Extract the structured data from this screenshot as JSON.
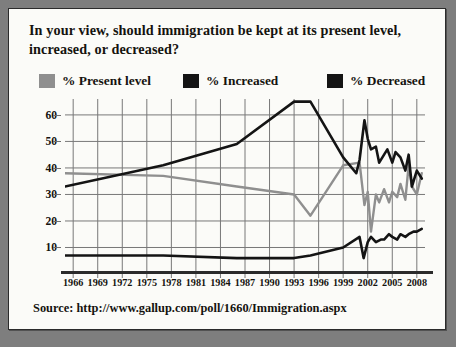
{
  "title": "In your view, should immigration be kept at its present level, increased, or decreased?",
  "source": "Source: http://www.gallup.com/poll/1660/Immigration.aspx",
  "legend": [
    {
      "label": "% Present level",
      "color": "#8f8f8f"
    },
    {
      "label": "% Increased",
      "color": "#141414"
    },
    {
      "label": "% Decreased",
      "color": "#141414"
    }
  ],
  "chart_data": {
    "type": "line",
    "title": "In your view, should immigration be kept at its present level, increased, or decreased?",
    "xlabel": "",
    "ylabel": "",
    "xlim": [
      1965,
      2009
    ],
    "ylim": [
      0,
      66
    ],
    "grid": true,
    "legend_position": "top",
    "tick_labels_x": [
      "1966",
      "1969",
      "1972",
      "1975",
      "1978",
      "1981",
      "1984",
      "1987",
      "1990",
      "1993",
      "1996",
      "1999",
      "2002",
      "2005",
      "2008"
    ],
    "tick_labels_y": [
      "10",
      "20",
      "30",
      "40",
      "50",
      "60"
    ],
    "yticks": [
      10,
      20,
      30,
      40,
      50,
      60
    ],
    "series": [
      {
        "name": "% Present level",
        "color": "#8f8f8f",
        "x": [
          1965,
          1977,
          1986,
          1993,
          1995,
          1999,
          2001,
          2001.6,
          2002,
          2002.4,
          2003,
          2003.4,
          2004,
          2004.6,
          2005,
          2005.6,
          2006,
          2006.6,
          2007,
          2007.4,
          2008,
          2008.6
        ],
        "values": [
          38,
          37,
          33,
          30,
          22,
          41,
          42,
          26,
          31,
          16,
          30,
          27,
          32,
          27,
          31,
          29,
          34,
          28,
          41,
          33,
          30,
          38
        ]
      },
      {
        "name": "% Increased",
        "color": "#141414",
        "x": [
          1965,
          1977,
          1986,
          1993,
          1995,
          1999,
          2001,
          2001.5,
          2002,
          2002.4,
          2003,
          2003.6,
          2004,
          2004.6,
          2005,
          2005.6,
          2006,
          2006.6,
          2007,
          2007.6,
          2008,
          2008.6
        ],
        "values": [
          7,
          7,
          6,
          6,
          7,
          10,
          14,
          6,
          12,
          14,
          12,
          13,
          13,
          15,
          14,
          13,
          15,
          14,
          15,
          16,
          16,
          17
        ]
      },
      {
        "name": "% Decreased",
        "color": "#141414",
        "x": [
          1965,
          1977,
          1986,
          1993,
          1995,
          1999,
          2000.6,
          2001,
          2001.6,
          2002,
          2002.4,
          2003,
          2003.4,
          2004,
          2004.4,
          2005,
          2005.4,
          2006,
          2006.6,
          2007,
          2007.4,
          2008,
          2008.6
        ],
        "values": [
          33,
          41,
          49,
          65,
          65,
          44,
          38,
          43,
          58,
          51,
          47,
          48,
          42,
          45,
          47,
          42,
          46,
          44,
          39,
          45,
          33,
          39,
          36
        ]
      }
    ]
  }
}
